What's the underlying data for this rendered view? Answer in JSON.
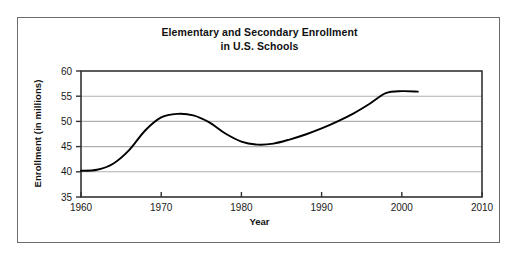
{
  "figure": {
    "title_line_1": "Elementary and Secondary Enrollment",
    "title_line_2": "in U.S. Schools",
    "border_color": "#6b6b6b",
    "background_color": "#ffffff"
  },
  "chart_data": {
    "type": "line",
    "title": "Elementary and Secondary Enrollment in U.S. Schools",
    "xlabel": "Year",
    "ylabel": "Enrollment (in millions)",
    "xlim": [
      1960,
      2010
    ],
    "ylim": [
      35,
      60
    ],
    "xticks": [
      "1960",
      "1970",
      "1980",
      "1990",
      "2000",
      "2010"
    ],
    "yticks": [
      "35",
      "40",
      "45",
      "50",
      "55",
      "60"
    ],
    "grid": "horizontal",
    "legend": "none",
    "line_color": "#000000",
    "gridline_color": "#b0b0b0",
    "axis_color": "#333333",
    "series": [
      {
        "name": "Enrollment (in millions)",
        "x": [
          1960,
          1962,
          1964,
          1966,
          1968,
          1970,
          1972,
          1974,
          1976,
          1978,
          1980,
          1982,
          1984,
          1986,
          1988,
          1990,
          1992,
          1994,
          1996,
          1998,
          2000,
          2002
        ],
        "values": [
          40.2,
          40.4,
          41.6,
          44.3,
          48.2,
          50.8,
          51.5,
          51.2,
          49.8,
          47.6,
          46.0,
          45.4,
          45.6,
          46.4,
          47.4,
          48.6,
          50.0,
          51.6,
          53.5,
          55.6,
          56.0,
          55.9
        ]
      }
    ]
  }
}
